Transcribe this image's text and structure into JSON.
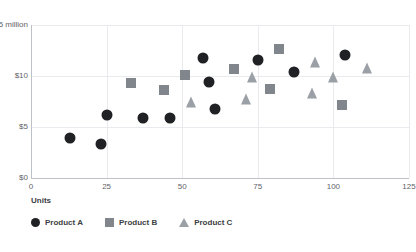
{
  "chart_data": {
    "type": "scatter",
    "title": "",
    "xlabel": "Units",
    "ylabel": "",
    "xlim": [
      0,
      125
    ],
    "ylim": [
      0,
      15
    ],
    "grid": true,
    "legend_position": "bottom-left",
    "x_ticks": [
      "0",
      "25",
      "50",
      "75",
      "100",
      "125"
    ],
    "x_tick_values": [
      0,
      25,
      50,
      75,
      100,
      125
    ],
    "y_ticks": [
      "$0",
      "$5",
      "$10",
      "$15 million"
    ],
    "y_tick_values": [
      0,
      5,
      10,
      15
    ],
    "y_unit": "million",
    "series": [
      {
        "name": "Product A",
        "marker": "circle",
        "color": "#202124",
        "points": [
          {
            "x": 13,
            "y": 3.9
          },
          {
            "x": 23,
            "y": 3.3
          },
          {
            "x": 25,
            "y": 6.2
          },
          {
            "x": 37,
            "y": 5.9
          },
          {
            "x": 46,
            "y": 5.9
          },
          {
            "x": 57,
            "y": 11.8
          },
          {
            "x": 59,
            "y": 9.4
          },
          {
            "x": 61,
            "y": 6.8
          },
          {
            "x": 75,
            "y": 11.6
          },
          {
            "x": 87,
            "y": 10.4
          },
          {
            "x": 104,
            "y": 12.1
          }
        ]
      },
      {
        "name": "Product B",
        "marker": "square",
        "color": "#80868b",
        "points": [
          {
            "x": 33,
            "y": 9.3
          },
          {
            "x": 44,
            "y": 8.6
          },
          {
            "x": 51,
            "y": 10.1
          },
          {
            "x": 67,
            "y": 10.7
          },
          {
            "x": 79,
            "y": 8.7
          },
          {
            "x": 82,
            "y": 12.6
          },
          {
            "x": 103,
            "y": 7.2
          }
        ]
      },
      {
        "name": "Product C",
        "marker": "triangle",
        "color": "#9aa0a6",
        "points": [
          {
            "x": 53,
            "y": 7.5
          },
          {
            "x": 71,
            "y": 7.7
          },
          {
            "x": 73,
            "y": 9.9
          },
          {
            "x": 93,
            "y": 8.3
          },
          {
            "x": 94,
            "y": 11.4
          },
          {
            "x": 100,
            "y": 9.9
          },
          {
            "x": 111,
            "y": 10.8
          }
        ]
      }
    ]
  },
  "colors": {
    "background": "#ffffff",
    "grid": "#e8eaed",
    "axis": "#bdc1c6",
    "tick_text": "#5f6368",
    "legend_text": "#3c4043",
    "product_a": "#202124",
    "product_b": "#80868b",
    "product_c": "#9aa0a6"
  }
}
